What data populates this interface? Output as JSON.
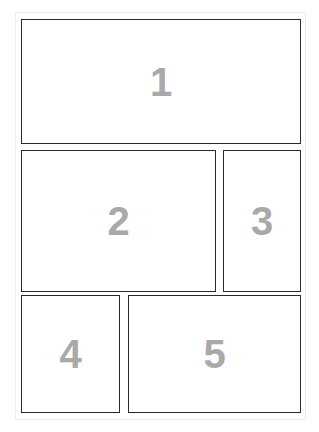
{
  "layout": {
    "title": "",
    "panels": [
      {
        "label": "1",
        "x": 21,
        "y": 19,
        "w": 280,
        "h": 125
      },
      {
        "label": "2",
        "x": 21,
        "y": 150,
        "w": 195,
        "h": 142
      },
      {
        "label": "3",
        "x": 223,
        "y": 150,
        "w": 78,
        "h": 142
      },
      {
        "label": "4",
        "x": 21,
        "y": 295,
        "w": 99,
        "h": 118
      },
      {
        "label": "5",
        "x": 128,
        "y": 295,
        "w": 173,
        "h": 118
      }
    ]
  },
  "colors": {
    "border": "#2a2a2a",
    "number": "#a9a9a9",
    "background": "#ffffff"
  }
}
